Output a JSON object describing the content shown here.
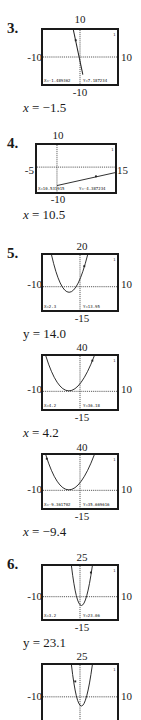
{
  "problems": [
    {
      "number": "3.",
      "graph": {
        "ymax": "10",
        "ymin": "-10",
        "xmin": "-10",
        "xmax": "10",
        "readout_x": "X=-1.489362",
        "readout_y": "Y=7.187234",
        "cursor_index": "1"
      },
      "answer_var": "x",
      "answer_val": " = −1.5"
    },
    {
      "number": "4.",
      "graph": {
        "ymax": "10",
        "ymin": "-10",
        "xmin": "-5",
        "xmax": "15",
        "readout_x": "X=10.531915",
        "readout_y": "Y=-4.387234",
        "cursor_index": "1"
      },
      "answer_var": "x",
      "answer_val": " = 10.5"
    },
    {
      "number": "5.",
      "graph": {
        "ymax": "20",
        "ymin": "-15",
        "xmin": "-10",
        "xmax": "10",
        "readout_x": "X=2.3",
        "readout_y": "Y=13.95",
        "cursor_index": "1"
      },
      "answer_var": "y",
      "answer_val": " = 14.0"
    },
    {
      "number": "",
      "graph": {
        "ymax": "40",
        "ymin": "-15",
        "xmin": "-10",
        "xmax": "10",
        "readout_x": "X=4.2",
        "readout_y": "Y=36.18",
        "cursor_index": "1"
      },
      "answer_var": "x",
      "answer_val": " = 4.2"
    },
    {
      "number": "",
      "graph": {
        "ymax": "40",
        "ymin": "-15",
        "xmin": "-10",
        "xmax": "10",
        "readout_x": "X=-9.361702",
        "readout_y": "Y=35.669616",
        "cursor_index": "1"
      },
      "answer_var": "x",
      "answer_val": " = −9.4"
    },
    {
      "number": "6.",
      "graph": {
        "ymax": "25",
        "ymin": "-15",
        "xmin": "-10",
        "xmax": "10",
        "readout_x": "X=3.2",
        "readout_y": "Y=23.06",
        "cursor_index": "1"
      },
      "answer_var": "y",
      "answer_val": " = 23.1"
    },
    {
      "number": "",
      "graph": {
        "ymax": "25",
        "ymin": "",
        "xmin": "-10",
        "xmax": "10",
        "readout_x": "",
        "readout_y": "",
        "cursor_index": "1"
      },
      "answer_var": "",
      "answer_val": ""
    }
  ]
}
